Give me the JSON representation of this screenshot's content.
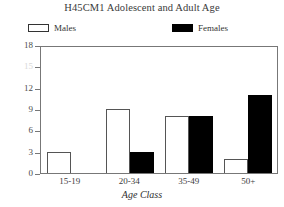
{
  "chart_data": {
    "type": "bar",
    "title": "H45CM1 Adolescent and Adult Age",
    "xlabel": "Age Class",
    "ylabel": "Number",
    "categories": [
      "15-19",
      "20-34",
      "35-49",
      "50+"
    ],
    "series": [
      {
        "name": "Males",
        "values": [
          3,
          9,
          8,
          2
        ],
        "color": "#ffffff",
        "edge": "#555555"
      },
      {
        "name": "Females",
        "values": [
          0,
          3,
          8,
          11
        ],
        "color": "#000000",
        "edge": "#000000"
      }
    ],
    "ylim": [
      0,
      18
    ],
    "yticks": [
      0,
      3,
      6,
      9,
      12,
      15,
      18
    ],
    "ytick_labels": [
      "0",
      "3",
      "6",
      "9",
      "12",
      "15",
      "18"
    ],
    "grid": false,
    "legend_position": "above-plot"
  },
  "legend": {
    "males_label": "Males",
    "females_label": "Females"
  }
}
